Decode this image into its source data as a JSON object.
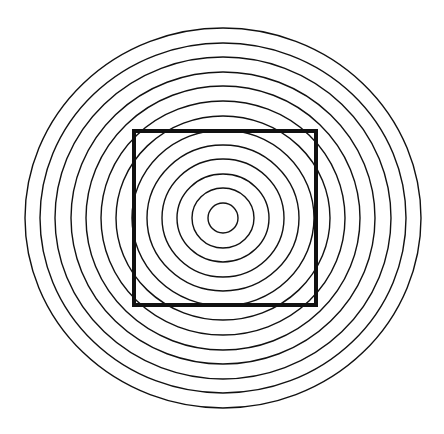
{
  "figure": {
    "background": "#ffffff",
    "stroke_color": "#111111",
    "center": [
      223,
      218
    ],
    "rings": {
      "count": 13,
      "radii_x": [
        15,
        31,
        46,
        61,
        76,
        91,
        107,
        122,
        137,
        152,
        168,
        183,
        198
      ],
      "radii_y": [
        15,
        30,
        44,
        59,
        73,
        88,
        102,
        117,
        132,
        146,
        161,
        175,
        190
      ],
      "stroke_width": 1.4
    },
    "square": {
      "x": 134,
      "y": 131,
      "width": 182,
      "height": 174,
      "stroke_width": 4
    }
  }
}
